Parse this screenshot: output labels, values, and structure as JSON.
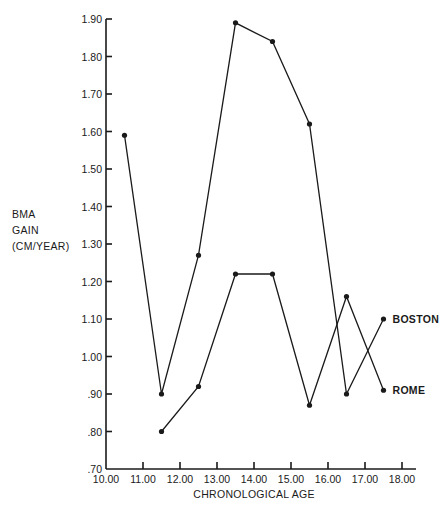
{
  "chart_data": {
    "type": "line",
    "title": "",
    "xlabel": "CHRONOLOGICAL AGE",
    "ylabel": [
      "BMA",
      "GAIN",
      "(CM/YEAR)"
    ],
    "xlim": [
      10.0,
      18.0
    ],
    "ylim": [
      0.7,
      1.9
    ],
    "x_ticks": [
      "10.00",
      "11.00",
      "12.00",
      "13.00",
      "14.00",
      "15.00",
      "16.00",
      "17.00",
      "18.00"
    ],
    "y_ticks": [
      ".70",
      ".80",
      ".90",
      "1.00",
      "1.10",
      "1.20",
      "1.30",
      "1.40",
      "1.50",
      "1.60",
      "1.70",
      "1.80",
      "1.90"
    ],
    "grid": false,
    "legend": "inline labels at right end of lines",
    "series": [
      {
        "name": "BOSTON",
        "x": [
          10.5,
          11.5,
          12.5,
          13.5,
          14.5,
          15.5,
          16.5,
          17.5
        ],
        "values": [
          1.59,
          0.9,
          1.27,
          1.89,
          1.84,
          1.62,
          0.9,
          1.1
        ]
      },
      {
        "name": "ROME",
        "x": [
          11.5,
          12.5,
          13.5,
          14.5,
          15.5,
          16.5,
          17.5
        ],
        "values": [
          0.8,
          0.92,
          1.22,
          1.22,
          0.87,
          1.16,
          0.91
        ]
      }
    ]
  },
  "colors": {
    "ink": "#1a1a1a",
    "background": "#ffffff"
  }
}
